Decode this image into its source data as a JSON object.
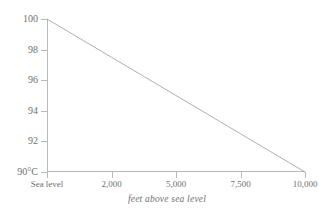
{
  "chart_data": {
    "type": "line",
    "title": "",
    "subtitle": "",
    "xlabel": "feet above sea level",
    "ylabel": "",
    "x": [
      0,
      2500,
      5000,
      7500,
      10000
    ],
    "series": [
      {
        "name": "boiling point of water",
        "values": [
          100,
          97.5,
          95,
          92.5,
          90
        ]
      }
    ],
    "xlim": [
      0,
      10000
    ],
    "ylim": [
      90,
      100
    ],
    "grid": false,
    "legend": "none",
    "x_tick_values": [
      0,
      2500,
      5000,
      7500,
      10000
    ],
    "x_tick_labels": [
      "Sea level",
      "2,000",
      "5,000",
      "7,500",
      "10,000"
    ],
    "y_tick_values": [
      90,
      92,
      94,
      96,
      98,
      100
    ],
    "y_tick_labels": [
      "90°C",
      "92",
      "94",
      "96",
      "98",
      "100"
    ],
    "line_color": "#9a9a9a",
    "axis_color": "#b9b9b9",
    "text_color": "#6f6f6f",
    "background_color": "#ffffff"
  },
  "axis": {
    "x_title": "feet above sea level"
  }
}
